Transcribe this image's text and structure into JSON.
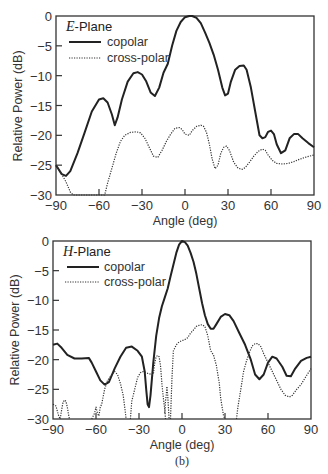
{
  "chart_data": [
    {
      "type": "line",
      "title": "E-Plane",
      "title_letter": "E",
      "title_rest": "-Plane",
      "xlabel": "Angle (deg)",
      "ylabel": "Relative Power (dB)",
      "xlim": [
        -90,
        90
      ],
      "ylim": [
        -30,
        0
      ],
      "xticks": [
        -90,
        -60,
        -30,
        0,
        30,
        60,
        90
      ],
      "xtick_labels": [
        "−90",
        "−60",
        "−30",
        "0",
        "30",
        "60",
        "90"
      ],
      "yticks": [
        0,
        -5,
        -10,
        -15,
        -20,
        -25,
        -30
      ],
      "ytick_labels": [
        "0",
        "−5",
        "−10",
        "−15",
        "−20",
        "−25",
        "−30"
      ],
      "grid": false,
      "legend_position": "upper left",
      "series": [
        {
          "name": "copolar",
          "style": "solid",
          "x": [
            -90,
            -86,
            -83,
            -80,
            -75,
            -70,
            -65,
            -60,
            -57,
            -54,
            -51,
            -49,
            -47,
            -44,
            -40,
            -36,
            -33,
            -30,
            -27,
            -24,
            -21,
            -18,
            -15,
            -12,
            -9,
            -6,
            -3,
            0,
            3,
            5,
            8,
            11,
            14,
            17,
            20,
            23,
            26,
            28,
            30,
            32,
            35,
            38,
            41,
            43,
            46,
            49,
            52,
            54,
            56,
            58,
            60,
            62,
            64,
            67,
            70,
            73,
            76,
            79,
            82,
            86,
            90
          ],
          "values": [
            -25,
            -26.5,
            -26.8,
            -26,
            -23,
            -19.5,
            -16,
            -14,
            -13.8,
            -14.5,
            -16.5,
            -18.3,
            -17,
            -14,
            -11,
            -9.6,
            -9.4,
            -9.8,
            -11,
            -12.8,
            -13.4,
            -12,
            -9.5,
            -8,
            -5,
            -2.5,
            -1,
            -0.2,
            0,
            0,
            -0.3,
            -1.2,
            -2.8,
            -4.5,
            -6.5,
            -9,
            -12,
            -13.3,
            -13,
            -11,
            -9,
            -8.4,
            -8.3,
            -9,
            -12,
            -16,
            -20,
            -20.5,
            -20.3,
            -19.4,
            -19.2,
            -19.8,
            -21.5,
            -23,
            -22.5,
            -20.5,
            -19.8,
            -19.8,
            -20.5,
            -21.3,
            -22
          ]
        },
        {
          "name": "cross-polar",
          "style": "dotted",
          "x": [
            -90,
            -86,
            -83,
            -80,
            -78,
            -56,
            -54,
            -51,
            -48,
            -45,
            -42,
            -38,
            -34,
            -31,
            -28,
            -25,
            -22,
            -19,
            -16,
            -13,
            -10,
            -7,
            -4,
            -2,
            0,
            3,
            5,
            8,
            11,
            13,
            15,
            17,
            19,
            21,
            23,
            25,
            27,
            29,
            31,
            34,
            37,
            40,
            42,
            45,
            48,
            51,
            54,
            56,
            58,
            61,
            64,
            68,
            72,
            76,
            80,
            85,
            90
          ],
          "values": [
            -25,
            -26.5,
            -27.8,
            -29.5,
            -30,
            -30,
            -28,
            -25.5,
            -23,
            -21,
            -20,
            -19.5,
            -19.4,
            -19.6,
            -20.5,
            -22,
            -23.5,
            -23.7,
            -22.5,
            -21,
            -19.8,
            -18.8,
            -18.7,
            -19,
            -19.8,
            -20,
            -19.2,
            -18.5,
            -18.3,
            -18.5,
            -19.5,
            -21.5,
            -24,
            -25.6,
            -25,
            -23,
            -22,
            -21.8,
            -22.5,
            -24.5,
            -25.5,
            -25.7,
            -25.4,
            -24.5,
            -23.5,
            -22.7,
            -22.3,
            -22.5,
            -23.3,
            -24.2,
            -24.7,
            -24.8,
            -24.7,
            -24.4,
            -24,
            -23.6,
            -23.3
          ]
        }
      ]
    },
    {
      "type": "line",
      "title": "H-Plane",
      "title_letter": "H",
      "title_rest": "-Plane",
      "caption": "(b)",
      "xlabel": "Angle (deg)",
      "ylabel": "Relative Power (dB)",
      "xlim": [
        -90,
        90
      ],
      "ylim": [
        -30,
        0
      ],
      "xticks": [
        -90,
        -60,
        -30,
        0,
        30,
        60,
        90
      ],
      "xtick_labels": [
        "−90",
        "−60",
        "−30",
        "0",
        "30",
        "60",
        "90"
      ],
      "yticks": [
        0,
        -5,
        -10,
        -15,
        -20,
        -25,
        -30
      ],
      "ytick_labels": [
        "0",
        "−5",
        "−10",
        "−15",
        "−20",
        "−25",
        "−30"
      ],
      "grid": false,
      "legend_position": "upper left",
      "series": [
        {
          "name": "copolar",
          "style": "solid",
          "x": [
            -90,
            -87,
            -84,
            -80,
            -75,
            -70,
            -65,
            -63,
            -60,
            -57,
            -54,
            -51,
            -47,
            -43,
            -39,
            -35,
            -31,
            -28,
            -26,
            -25,
            -24,
            -23,
            -22,
            -20,
            -18,
            -16,
            -14,
            -12,
            -10,
            -8,
            -6,
            -4,
            -2,
            0,
            2,
            4,
            6,
            8,
            10,
            12,
            14,
            16,
            18,
            20,
            22,
            24,
            27,
            30,
            33,
            36,
            40,
            44,
            48,
            51,
            54,
            57,
            60,
            63,
            66,
            70,
            73,
            76,
            79,
            83,
            87,
            90
          ],
          "values": [
            -17.5,
            -17.3,
            -18,
            -19.2,
            -19.8,
            -19.8,
            -19.7,
            -20.5,
            -22,
            -23.5,
            -24.2,
            -23.8,
            -21.5,
            -19.5,
            -18,
            -17.8,
            -18.5,
            -19.5,
            -22,
            -25,
            -27.5,
            -28,
            -26,
            -20.5,
            -16,
            -13,
            -11,
            -9.5,
            -8,
            -6,
            -4,
            -2,
            -0.6,
            0,
            -0.2,
            -0.8,
            -2,
            -3.5,
            -5.5,
            -8,
            -10.5,
            -12.5,
            -14,
            -14.8,
            -14.8,
            -14,
            -12.8,
            -12.3,
            -12.5,
            -13.5,
            -15.5,
            -17.5,
            -20,
            -22.5,
            -23.3,
            -22.5,
            -20.5,
            -19.5,
            -19.8,
            -21.2,
            -22.7,
            -22.8,
            -21.5,
            -20.2,
            -19.7,
            -19.5
          ]
        },
        {
          "name": "cross-polar",
          "style": "dotted",
          "segments": [
            {
              "x": [
                -90,
                -88,
                -86,
                -85,
                -84,
                -83,
                -82,
                -81,
                -80,
                -79,
                -78.5
              ],
              "values": [
                -27.5,
                -27.8,
                -29.5,
                -30,
                -28.5,
                -27.2,
                -26.8,
                -27,
                -28,
                -29.5,
                -30
              ]
            },
            {
              "x": [
                -63,
                -61,
                -60,
                -59,
                -58,
                -57,
                -56,
                -54,
                -52,
                -49,
                -47,
                -45,
                -43,
                -41,
                -40,
                -39
              ],
              "values": [
                -30,
                -29,
                -28,
                -29,
                -29.5,
                -28,
                -27.5,
                -25,
                -23.5,
                -22.5,
                -22,
                -22.5,
                -24,
                -26,
                -28,
                -30
              ]
            },
            {
              "x": [
                -36,
                -35,
                -33,
                -31,
                -29,
                -27,
                -24,
                -21,
                -20,
                -19,
                -18,
                -17,
                -16,
                -15,
                -14,
                -13,
                -12,
                -11.5
              ],
              "values": [
                -30,
                -27,
                -25,
                -23,
                -22.2,
                -22,
                -22.3,
                -22.5,
                -22.5,
                -20.5,
                -19.5,
                -19.3,
                -19.5,
                -21,
                -24,
                -26.5,
                -28.5,
                -30
              ]
            },
            {
              "x": [
                -12,
                -11.5,
                -11,
                -10.5,
                -10,
                -9.5,
                -9
              ],
              "values": [
                -29,
                -27,
                -26,
                -24.5,
                -26,
                -28,
                -30
              ]
            },
            {
              "x": [
                -8,
                -7,
                -6,
                -4,
                -2,
                0,
                2,
                4,
                6,
                8,
                10,
                12,
                14,
                16,
                18,
                20,
                22,
                24,
                26,
                27,
                28,
                29,
                30
              ],
              "values": [
                -30,
                -23,
                -18.5,
                -17.5,
                -17,
                -16.8,
                -16.6,
                -16.3,
                -15.5,
                -15,
                -14.4,
                -14.2,
                -14.1,
                -14.4,
                -16,
                -18.5,
                -19.2,
                -21,
                -24,
                -26.5,
                -28,
                -29.5,
                -30
              ]
            },
            {
              "x": [
                38,
                39,
                41,
                43,
                45,
                47,
                49,
                51,
                53,
                55,
                57,
                60,
                63,
                66,
                69,
                72,
                75,
                77,
                80,
                83,
                86,
                90
              ],
              "values": [
                -30,
                -28,
                -25,
                -22,
                -20.2,
                -18.8,
                -17.7,
                -17.3,
                -17.3,
                -17.8,
                -19,
                -20.5,
                -22,
                -23.5,
                -25,
                -26,
                -26.3,
                -26,
                -25,
                -24.2,
                -23,
                -21.5
              ]
            }
          ]
        }
      ]
    }
  ]
}
